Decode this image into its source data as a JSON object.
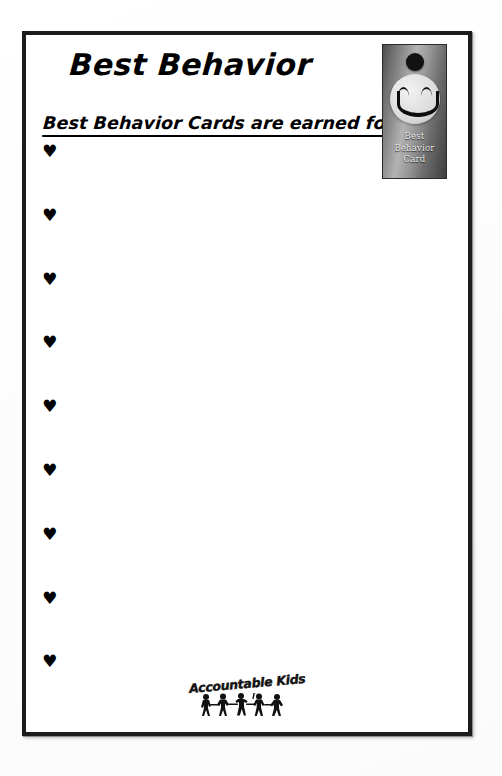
{
  "document": {
    "title": "Best Behavior",
    "subtitle": "Best Behavior Cards are earned for:",
    "bullets": [
      {
        "icon": "heart-icon",
        "glyph": "♥",
        "text": ""
      },
      {
        "icon": "heart-icon",
        "glyph": "♥",
        "text": ""
      },
      {
        "icon": "heart-icon",
        "glyph": "♥",
        "text": ""
      },
      {
        "icon": "heart-icon",
        "glyph": "♥",
        "text": ""
      },
      {
        "icon": "heart-icon",
        "glyph": "♥",
        "text": ""
      },
      {
        "icon": "heart-icon",
        "glyph": "♥",
        "text": ""
      },
      {
        "icon": "heart-icon",
        "glyph": "♥",
        "text": ""
      },
      {
        "icon": "heart-icon",
        "glyph": "♥",
        "text": ""
      },
      {
        "icon": "heart-icon",
        "glyph": "♥",
        "text": ""
      }
    ]
  },
  "card_thumbnail": {
    "icon": "smiley-face-icon",
    "caption_line_1": "Best",
    "caption_line_2": "Behavior",
    "caption_line_3": "Card"
  },
  "brand": {
    "wordmark": "Accountable Kids",
    "icon": "children-silhouettes-icon"
  },
  "colors": {
    "ink": "#000000",
    "frame": "#1c1c1c",
    "paper": "#ffffff",
    "page_background": "#fdfdfd",
    "card_metal_light": "#b3b3b3",
    "card_metal_dark": "#3f3f3f"
  }
}
